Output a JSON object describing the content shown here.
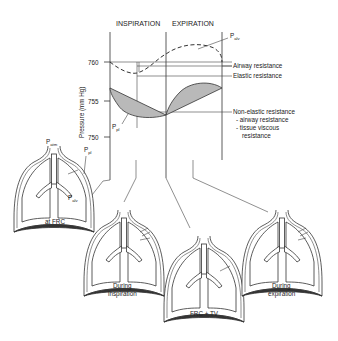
{
  "headers": {
    "inspiration": "INSPIRATION",
    "expiration": "EXPIRATION"
  },
  "axis": {
    "ylabel": "Pressure (mm Hg)",
    "ticks": [
      "760",
      "755",
      "750"
    ]
  },
  "curve_labels": {
    "p_alv": {
      "main": "P",
      "sub": "alv"
    },
    "p_pl": {
      "main": "P",
      "sub": "pl"
    }
  },
  "legend": {
    "airway_resistance": "Airway resistance",
    "elastic_resistance": "Elastic resistance",
    "non_elastic": "Non-elastic resistance",
    "non_elastic_item1": "- airway resistance",
    "non_elastic_item2": "- tissue viscous",
    "non_elastic_item2b": "resistance"
  },
  "lungs": {
    "frc": {
      "caption": "at FRC",
      "p_atm": {
        "main": "P",
        "sub": "atm"
      },
      "p_pl": {
        "main": "P",
        "sub": "pl"
      },
      "p_alv": {
        "main": "P",
        "sub": "alv"
      }
    },
    "inspiration": {
      "caption_line1": "During",
      "caption_line2": "inspiration"
    },
    "frc_tv": {
      "caption": "FRC + TV"
    },
    "expiration": {
      "caption_line1": "During",
      "caption_line2": "expiration"
    }
  },
  "colors": {
    "shade": "#b9b9b9",
    "line": "#333333"
  }
}
